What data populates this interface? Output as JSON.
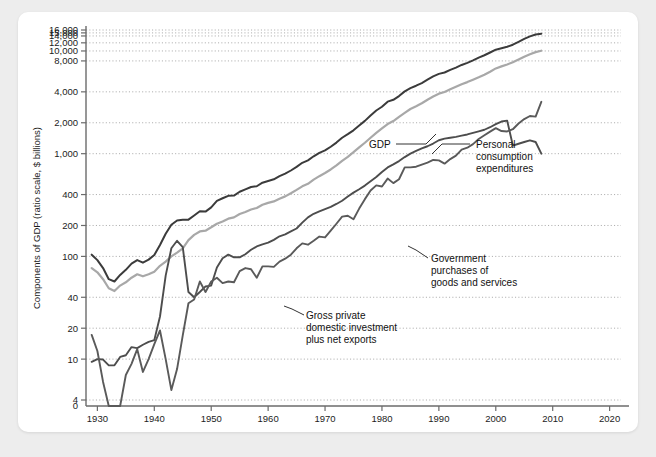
{
  "figure": {
    "background_color": "#ededed",
    "card_color": "#ffffff"
  },
  "chart_data": {
    "type": "line",
    "title": "",
    "xlabel": "Year",
    "ylabel": "Components of GDP (ratio scale, $ billions)",
    "scale": "log",
    "grid": "horizontal-dotted",
    "legend": "inline-annotations",
    "xlim": [
      1928,
      2022
    ],
    "ylim": [
      4,
      16000
    ],
    "xticks": [
      1930,
      1940,
      1950,
      1960,
      1970,
      1980,
      1990,
      2000,
      2010,
      2020
    ],
    "xtick_labels": [
      "1930",
      "1940",
      "1950",
      "1960",
      "1970",
      "1980",
      "1990",
      "2000",
      "2010",
      "2020"
    ],
    "yticks": [
      4,
      10,
      20,
      40,
      100,
      200,
      400,
      1000,
      2000,
      4000,
      8000,
      10000,
      12000,
      14000,
      15000,
      16000
    ],
    "ytick_labels": [
      "4",
      "10",
      "20",
      "40",
      "100",
      "200",
      "400",
      "1,000",
      "2,000",
      "4,000",
      "8,000",
      "10,000",
      "12,000",
      "14,000",
      "15,000",
      "16,000"
    ],
    "zero_tick_label": "0",
    "colors": {
      "gdp": "#3b3b3b",
      "personal_consumption_expenditures": "#a8a8a8",
      "government_purchases": "#4d4d4d",
      "gross_private_investment": "#5a5a5a"
    },
    "series": [
      {
        "name": "GDP",
        "color": "#3b3b3b",
        "annotation": "GDP",
        "x": [
          1929,
          1930,
          1931,
          1932,
          1933,
          1934,
          1935,
          1936,
          1937,
          1938,
          1939,
          1940,
          1941,
          1942,
          1943,
          1944,
          1945,
          1946,
          1947,
          1948,
          1949,
          1950,
          1951,
          1952,
          1953,
          1954,
          1955,
          1956,
          1957,
          1958,
          1959,
          1960,
          1961,
          1962,
          1963,
          1964,
          1965,
          1966,
          1967,
          1968,
          1969,
          1970,
          1971,
          1972,
          1973,
          1974,
          1975,
          1976,
          1977,
          1978,
          1979,
          1980,
          1981,
          1982,
          1983,
          1984,
          1985,
          1986,
          1987,
          1988,
          1989,
          1990,
          1991,
          1992,
          1993,
          1994,
          1995,
          1996,
          1997,
          1998,
          1999,
          2000,
          2001,
          2002,
          2003,
          2004,
          2005,
          2006,
          2007,
          2008
        ],
        "values": [
          104,
          92,
          77,
          60,
          57,
          66,
          74,
          85,
          92,
          87,
          93,
          103,
          129,
          166,
          203,
          224,
          228,
          228,
          250,
          275,
          273,
          300,
          347,
          368,
          389,
          391,
          426,
          450,
          474,
          482,
          522,
          543,
          563,
          605,
          639,
          686,
          744,
          815,
          862,
          943,
          1020,
          1076,
          1168,
          1282,
          1429,
          1549,
          1689,
          1878,
          2086,
          2357,
          2632,
          2863,
          3211,
          3345,
          3638,
          4041,
          4347,
          4590,
          4870,
          5253,
          5658,
          5980,
          6174,
          6539,
          6879,
          7309,
          7664,
          8100,
          8609,
          9089,
          9661,
          10285,
          10622,
          10978,
          11511,
          12275,
          13094,
          13856,
          14478,
          14721
        ]
      },
      {
        "name": "Personal consumption expenditures",
        "color": "#a8a8a8",
        "annotation": "Personal consumption expenditures",
        "x": [
          1929,
          1930,
          1931,
          1932,
          1933,
          1934,
          1935,
          1936,
          1937,
          1938,
          1939,
          1940,
          1941,
          1942,
          1943,
          1944,
          1945,
          1946,
          1947,
          1948,
          1949,
          1950,
          1951,
          1952,
          1953,
          1954,
          1955,
          1956,
          1957,
          1958,
          1959,
          1960,
          1961,
          1962,
          1963,
          1964,
          1965,
          1966,
          1967,
          1968,
          1969,
          1970,
          1971,
          1972,
          1973,
          1974,
          1975,
          1976,
          1977,
          1978,
          1979,
          1980,
          1981,
          1982,
          1983,
          1984,
          1985,
          1986,
          1987,
          1988,
          1989,
          1990,
          1991,
          1992,
          1993,
          1994,
          1995,
          1996,
          1997,
          1998,
          1999,
          2000,
          2001,
          2002,
          2003,
          2004,
          2005,
          2006,
          2007,
          2008
        ],
        "values": [
          77,
          70,
          60,
          49,
          46,
          52,
          56,
          62,
          67,
          64,
          67,
          71,
          81,
          89,
          100,
          109,
          120,
          144,
          162,
          175,
          178,
          192,
          208,
          219,
          233,
          240,
          259,
          271,
          286,
          296,
          318,
          332,
          343,
          364,
          384,
          412,
          444,
          481,
          509,
          559,
          604,
          648,
          702,
          770,
          852,
          933,
          1034,
          1152,
          1278,
          1430,
          1596,
          1762,
          1944,
          2079,
          2286,
          2498,
          2723,
          2899,
          3100,
          3353,
          3598,
          3840,
          3986,
          4235,
          4478,
          4743,
          4976,
          5257,
          5547,
          5880,
          6282,
          6762,
          7074,
          7385,
          7764,
          8258,
          8794,
          9304,
          9750,
          10058
        ]
      },
      {
        "name": "Government purchases of goods and services",
        "color": "#4d4d4d",
        "annotation": "Government purchases of goods and services",
        "x": [
          1929,
          1930,
          1931,
          1932,
          1933,
          1934,
          1935,
          1936,
          1937,
          1938,
          1939,
          1940,
          1941,
          1942,
          1943,
          1944,
          1945,
          1946,
          1947,
          1948,
          1949,
          1950,
          1951,
          1952,
          1953,
          1954,
          1955,
          1956,
          1957,
          1958,
          1959,
          1960,
          1961,
          1962,
          1963,
          1964,
          1965,
          1966,
          1967,
          1968,
          1969,
          1970,
          1971,
          1972,
          1973,
          1974,
          1975,
          1976,
          1977,
          1978,
          1979,
          1980,
          1981,
          1982,
          1983,
          1984,
          1985,
          1986,
          1987,
          1988,
          1989,
          1990,
          1991,
          1992,
          1993,
          1994,
          1995,
          1996,
          1997,
          1998,
          1999,
          2000,
          2001,
          2002,
          2003,
          2004,
          2005,
          2006,
          2007,
          2008
        ],
        "values": [
          9.4,
          10.0,
          9.9,
          8.7,
          8.7,
          10.5,
          10.9,
          13.1,
          12.8,
          13.8,
          14.7,
          15.3,
          26.0,
          65.0,
          120.0,
          142.0,
          123.0,
          45.0,
          40.0,
          45.0,
          51.0,
          52.0,
          78.0,
          96.0,
          104.0,
          98.0,
          98.0,
          105.0,
          116.0,
          125.0,
          131.0,
          136.0,
          145.0,
          157.0,
          164.0,
          175.0,
          187.0,
          213.0,
          240.0,
          260.0,
          274.0,
          288.0,
          303.0,
          324.0,
          348.0,
          383.0,
          418.0,
          451.0,
          489.0,
          539.0,
          592.0,
          664.0,
          735.0,
          787.0,
          847.0,
          927.0,
          1000.0,
          1063.0,
          1125.0,
          1181.0,
          1256.0,
          1351.0,
          1400.0,
          1429.0,
          1458.0,
          1497.0,
          1539.0,
          1593.0,
          1650.0,
          1710.0,
          1810.0,
          1937.0,
          2056.0,
          2100.0,
          1200.0,
          1250.0,
          1300.0,
          1350.0,
          1300.0,
          1000.0
        ]
      },
      {
        "name": "Gross private domestic investment plus net exports",
        "color": "#5a5a5a",
        "annotation": "Gross private domestic investment plus net exports",
        "x": [
          1929,
          1930,
          1931,
          1932,
          1933,
          1934,
          1935,
          1936,
          1937,
          1938,
          1939,
          1940,
          1941,
          1942,
          1943,
          1944,
          1945,
          1946,
          1947,
          1948,
          1949,
          1950,
          1951,
          1952,
          1953,
          1954,
          1955,
          1956,
          1957,
          1958,
          1959,
          1960,
          1961,
          1962,
          1963,
          1964,
          1965,
          1966,
          1967,
          1968,
          1969,
          1970,
          1971,
          1972,
          1973,
          1974,
          1975,
          1976,
          1977,
          1978,
          1979,
          1980,
          1981,
          1982,
          1983,
          1984,
          1985,
          1986,
          1987,
          1988,
          1989,
          1990,
          1991,
          1992,
          1993,
          1994,
          1995,
          1996,
          1997,
          1998,
          1999,
          2000,
          2001,
          2002,
          2003,
          2004,
          2005,
          2006,
          2007,
          2008
        ],
        "values": [
          17.2,
          12.0,
          6.0,
          1.0,
          1.6,
          3.9,
          7.0,
          9.0,
          12.5,
          7.5,
          10.0,
          14.0,
          19.0,
          10.0,
          5.0,
          8.0,
          17.0,
          35.0,
          38.0,
          57.0,
          45.0,
          57.0,
          62.0,
          55.0,
          57.0,
          56.0,
          72.0,
          77.0,
          75.0,
          62.0,
          80.0,
          80.0,
          79.0,
          89.0,
          95.0,
          104.0,
          120.0,
          134.0,
          130.0,
          142.0,
          156.0,
          153.0,
          178.0,
          208.0,
          244.0,
          249.0,
          230.0,
          292.0,
          361.0,
          438.0,
          492.0,
          479.0,
          572.0,
          517.0,
          564.0,
          735.0,
          736.0,
          747.0,
          784.0,
          819.0,
          869.0,
          861.0,
          800.0,
          886.0,
          958.0,
          1097.0,
          1144.0,
          1240.0,
          1389.0,
          1510.0,
          1641.0,
          1772.0,
          1661.0,
          1647.0,
          1730.0,
          1969.0,
          2172.0,
          2327.0,
          2295.0,
          3200.0
        ]
      }
    ],
    "annotations": [
      {
        "name": "gdp-annotation",
        "text": "GDP",
        "x": 1974,
        "y": 3100
      },
      {
        "name": "pce-annotation",
        "text": "Personal consumption expenditures",
        "lines": [
          "Personal",
          "consumption",
          "expenditures"
        ],
        "x": 1988,
        "y": 3100
      },
      {
        "name": "government-annotation",
        "text": "Government purchases of goods and services",
        "lines": [
          "Government",
          "purchases of",
          "goods and services"
        ],
        "x": 1984,
        "y": 330
      },
      {
        "name": "investment-annotation",
        "text": "Gross private domestic investment plus net exports",
        "lines": [
          "Gross private",
          "domestic investment",
          "plus net exports"
        ],
        "x": 1963,
        "y": 70
      }
    ]
  }
}
